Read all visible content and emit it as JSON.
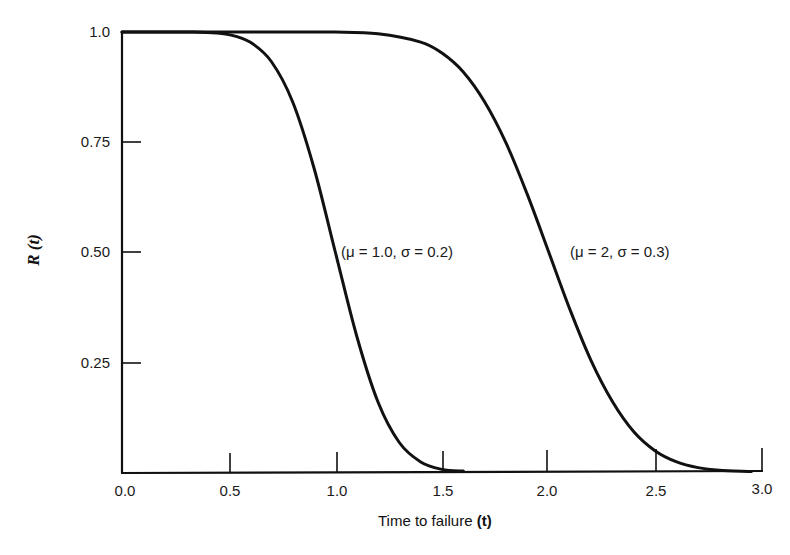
{
  "chart_data": {
    "type": "line",
    "title": "",
    "xlabel": "Time to failure (t)",
    "ylabel": "R (t)",
    "xlim": [
      0.0,
      3.0
    ],
    "ylim": [
      0.0,
      1.0
    ],
    "grid": false,
    "legend": "none (inline annotations)",
    "x_ticks": [
      "0.0",
      "0.5",
      "1.0",
      "1.5",
      "2.0",
      "2.5",
      "3.0"
    ],
    "y_ticks": [
      "1.0",
      "0.75",
      "0.50",
      "0.25"
    ],
    "series": [
      {
        "name": "(μ = 1.0, σ = 0.2)",
        "mu": 1.0,
        "sigma": 0.2,
        "x": [
          0.0,
          0.3,
          0.4,
          0.5,
          0.6,
          0.7,
          0.8,
          0.9,
          1.0,
          1.1,
          1.2,
          1.3,
          1.4,
          1.5,
          1.6
        ],
        "values": [
          1.0,
          1.0,
          0.999,
          0.994,
          0.977,
          0.933,
          0.841,
          0.691,
          0.5,
          0.309,
          0.159,
          0.067,
          0.023,
          0.006,
          0.002
        ]
      },
      {
        "name": "(μ = 2, σ = 0.3)",
        "mu": 2.0,
        "sigma": 0.3,
        "x": [
          0.0,
          0.8,
          1.0,
          1.2,
          1.4,
          1.5,
          1.6,
          1.7,
          1.8,
          1.9,
          2.0,
          2.1,
          2.2,
          2.3,
          2.4,
          2.5,
          2.6,
          2.7,
          2.8,
          2.95
        ],
        "values": [
          1.0,
          1.0,
          1.0,
          0.996,
          0.977,
          0.952,
          0.909,
          0.841,
          0.748,
          0.631,
          0.5,
          0.369,
          0.252,
          0.159,
          0.091,
          0.048,
          0.023,
          0.01,
          0.004,
          0.001
        ]
      }
    ],
    "annotations": [
      {
        "text": "(μ = 1.0, σ = 0.2)",
        "x": 1.05,
        "y": 0.5
      },
      {
        "text": "(μ = 2, σ = 0.3)",
        "x": 2.1,
        "y": 0.5
      }
    ]
  },
  "labels": {
    "y_title": "R (t)",
    "x_title_prefix": "Time to failure",
    "x_title_var": "(t)",
    "annot_1": "(μ = 1.0, σ = 0.2)",
    "annot_2": "(μ = 2, σ = 0.3)",
    "y_ticks": [
      "1.0",
      "0.75",
      "0.50",
      "0.25"
    ],
    "x_ticks": [
      "0.0",
      "0.5",
      "1.0",
      "1.5",
      "2.0",
      "2.5",
      "3.0"
    ]
  },
  "colors": {
    "line": "#111111",
    "background": "#ffffff"
  }
}
